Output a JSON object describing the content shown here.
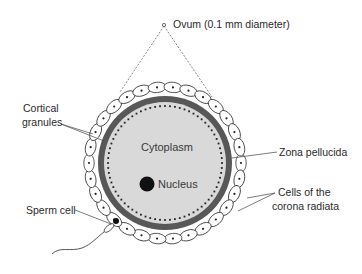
{
  "diagram": {
    "type": "labeled anatomical diagram",
    "colors": {
      "cytoplasm": "#d9d9d9",
      "zona_pellucida": "#585858",
      "cortical_granules": "#222222",
      "nucleus": "#111111",
      "corona_cells_fill": "#ffffff",
      "outline": "#333333"
    },
    "labels": {
      "ovum": "Ovum (0.1 mm diameter)",
      "cortical_granules_line1": "Cortical",
      "cortical_granules_line2": "granules",
      "cytoplasm": "Cytoplasm",
      "nucleus": "Nucleus",
      "zona_pellucida": "Zona pellucida",
      "corona_line1": "Cells of the",
      "corona_line2": "corona radiata",
      "sperm_cell": "Sperm cell"
    }
  }
}
